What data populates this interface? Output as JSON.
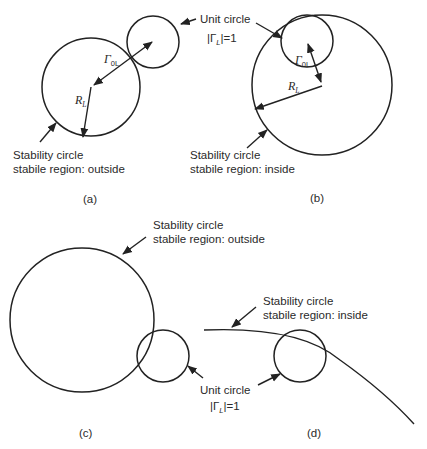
{
  "figure": {
    "panels": [
      {
        "id": "a",
        "caption": "(a)",
        "stability_circle": {
          "cx": 91,
          "cy": 87,
          "r": 49,
          "label_line1": "Stability circle",
          "label_line2": "stabile region: outside"
        },
        "unit_circle": {
          "cx": 153,
          "cy": 42,
          "r": 26,
          "label_line1": "Unit circle",
          "label_line2_prefix": "|Γ",
          "label_line2_sub": "L",
          "label_line2_suffix": "|=1"
        },
        "gamma_label": "Γ",
        "gamma_sub": "0L",
        "radius_label": "R",
        "radius_sub": "L"
      },
      {
        "id": "b",
        "caption": "(b)",
        "stability_circle": {
          "cx": 322,
          "cy": 85,
          "r": 70,
          "label_line1": "Stability circle",
          "label_line2": "stabile region: inside"
        },
        "unit_circle": {
          "cx": 307,
          "cy": 41,
          "r": 26
        },
        "gamma_label": "Γ",
        "gamma_sub": "0L",
        "radius_label": "R",
        "radius_sub": "L"
      },
      {
        "id": "c",
        "caption": "(c)",
        "stability_circle": {
          "cx": 82,
          "cy": 320,
          "r": 72,
          "label_line1": "Stability circle",
          "label_line2": "stabile region: outside"
        },
        "unit_circle": {
          "cx": 163,
          "cy": 356,
          "r": 26,
          "label_line1": "Unit circle",
          "label_line2_prefix": "|Γ",
          "label_line2_sub": "L",
          "label_line2_suffix": "|=1"
        }
      },
      {
        "id": "d",
        "caption": "(d)",
        "stability_arc": {
          "label_line1": "Stability circle",
          "label_line2": "stabile region: inside"
        },
        "unit_circle": {
          "cx": 300,
          "cy": 356,
          "r": 26
        }
      }
    ],
    "colors": {
      "stroke": "#222222",
      "text": "#2a2a2a",
      "background": "#ffffff"
    }
  }
}
